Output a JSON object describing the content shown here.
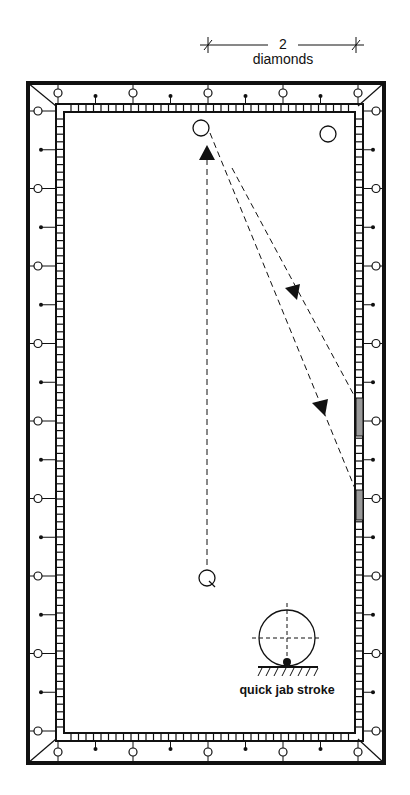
{
  "diagram": {
    "dimension": {
      "value": "2",
      "unit": "diamonds"
    },
    "caption": "quick jab stroke",
    "colors": {
      "ink": "#111111",
      "shade": "#9a9a9a",
      "background": "#ffffff"
    },
    "table": {
      "frame_outer": [
        26,
        81,
        386,
        765
      ],
      "cushion": [
        56,
        104,
        363,
        741
      ],
      "diamonds_per_long_rail": 8,
      "diamonds_per_short_rail": 4
    },
    "balls": {
      "object_ball_1": {
        "x": 201,
        "y": 128,
        "r": 8
      },
      "object_ball_2": {
        "x": 328,
        "y": 134,
        "r": 8
      },
      "cue_ball": {
        "x": 207,
        "y": 578,
        "r": 8
      }
    },
    "paths": [
      {
        "name": "cue-ball-path",
        "from": [
          207,
          565
        ],
        "to": [
          207,
          158
        ]
      },
      {
        "name": "first-object-path",
        "from": [
          210,
          133
        ],
        "to": [
          356,
          491
        ]
      },
      {
        "name": "second-path",
        "from": [
          232,
          168
        ],
        "to": [
          356,
          399
        ]
      }
    ],
    "contact_zones": [
      {
        "y1": 398,
        "y2": 436
      },
      {
        "y1": 490,
        "y2": 520
      }
    ],
    "stroke_diagram": {
      "cx": 287,
      "cy": 638,
      "r": 28,
      "tip_offset_y": 22
    }
  }
}
